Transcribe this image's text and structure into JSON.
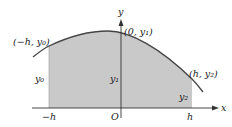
{
  "diagram": {
    "title": "",
    "axes": {
      "x_label": "x",
      "y_label": "y",
      "origin_label": "O"
    },
    "ticks": {
      "left": "−h",
      "right": "h"
    },
    "points": {
      "left": "(−h, y₀)",
      "middle": "(0, y₁)",
      "right": "(h, y₂)"
    },
    "ordinates": {
      "left": "y₀",
      "middle": "y₁",
      "right": "y₂"
    },
    "colors": {
      "fill": "#c8c8c8",
      "curve": "#444444",
      "axis": "#333333"
    }
  }
}
